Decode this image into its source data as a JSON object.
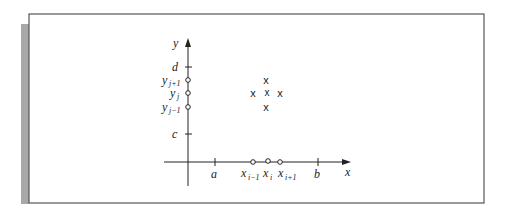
{
  "figure": {
    "axes": {
      "x_label": "x",
      "y_label": "y"
    },
    "x_ticks": [
      {
        "label": "a"
      },
      {
        "label": "b"
      }
    ],
    "y_ticks": [
      {
        "label": "d"
      },
      {
        "label": "c"
      }
    ],
    "x_nodes": [
      {
        "base": "x",
        "sub": "i−1"
      },
      {
        "base": "x",
        "sub": "i"
      },
      {
        "base": "x",
        "sub": "i+1"
      }
    ],
    "y_nodes": [
      {
        "base": "y",
        "sub": "j+1"
      },
      {
        "base": "y",
        "sub": "j"
      },
      {
        "base": "y",
        "sub": "j−1"
      }
    ],
    "stencil_marker": "x",
    "colors": {
      "frame": "#555555",
      "shadow": "#a8a8a8",
      "ink": "#222222"
    }
  }
}
